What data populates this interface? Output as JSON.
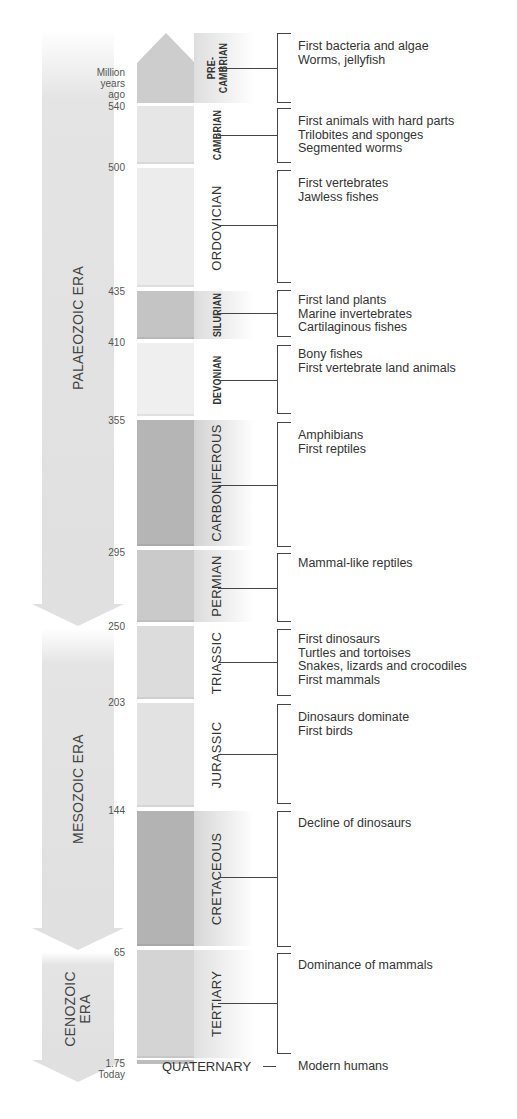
{
  "axis": {
    "unit_label": [
      "Million",
      "years",
      "ago"
    ],
    "ticks": [
      "540",
      "500",
      "435",
      "410",
      "355",
      "295",
      "250",
      "203",
      "144",
      "65",
      "1.75"
    ],
    "today_label": "Today"
  },
  "eras": [
    {
      "name": "PALAEOZOIC ERA",
      "from": 540,
      "to": 250
    },
    {
      "name": "MESOZOIC ERA",
      "from": 250,
      "to": 65
    },
    {
      "name": "CENOZOIC ERA",
      "name_lines": [
        "CENOZOIC",
        "ERA"
      ],
      "from": 65,
      "to": 0
    }
  ],
  "periods": [
    {
      "name": "PRE-CAMBRIAN",
      "name_lines": [
        "PRE-",
        "CAMBRIAN"
      ],
      "start": null,
      "end": 540,
      "color": "#cfcfcf",
      "facts": [
        "First bacteria and algae",
        "Worms, jellyfish"
      ]
    },
    {
      "name": "CAMBRIAN",
      "start": 540,
      "end": 500,
      "color": "#e6e6e6",
      "facts": [
        "First animals with hard parts",
        "Trilobites and sponges",
        "Segmented worms"
      ]
    },
    {
      "name": "ORDOVICIAN",
      "start": 500,
      "end": 435,
      "color": "#ececec",
      "facts": [
        "First vertebrates",
        "Jawless fishes"
      ]
    },
    {
      "name": "SILURIAN",
      "start": 435,
      "end": 410,
      "color": "#c4c4c4",
      "facts": [
        "First land plants",
        "Marine invertebrates",
        "Cartilaginous fishes"
      ]
    },
    {
      "name": "DEVONIAN",
      "start": 410,
      "end": 355,
      "color": "#efefef",
      "facts": [
        "Bony fishes",
        "First vertebrate land animals"
      ]
    },
    {
      "name": "CARBONIFEROUS",
      "start": 355,
      "end": 295,
      "color": "#b5b5b5",
      "facts": [
        "Amphibians",
        "First reptiles"
      ]
    },
    {
      "name": "PERMIAN",
      "start": 295,
      "end": 250,
      "color": "#cacaca",
      "facts": [
        "Mammal-like reptiles"
      ]
    },
    {
      "name": "TRIASSIC",
      "start": 250,
      "end": 203,
      "color": "#dcdcdc",
      "facts": [
        "First dinosaurs",
        "Turtles and tortoises",
        "Snakes, lizards and crocodiles",
        "First mammals"
      ]
    },
    {
      "name": "JURASSIC",
      "start": 203,
      "end": 144,
      "color": "#e2e2e2",
      "facts": [
        "Dinosaurs dominate",
        "First birds"
      ]
    },
    {
      "name": "CRETACEOUS",
      "start": 144,
      "end": 65,
      "color": "#b3b3b3",
      "facts": [
        "Decline of dinosaurs"
      ]
    },
    {
      "name": "TERTIARY",
      "start": 65,
      "end": 1.75,
      "color": "#d4d4d4",
      "facts": [
        "Dominance of mammals"
      ]
    },
    {
      "name": "QUATERNARY",
      "start": 1.75,
      "end": 0,
      "color": "#c8c8c8",
      "facts": [
        "Modern humans"
      ]
    }
  ]
}
